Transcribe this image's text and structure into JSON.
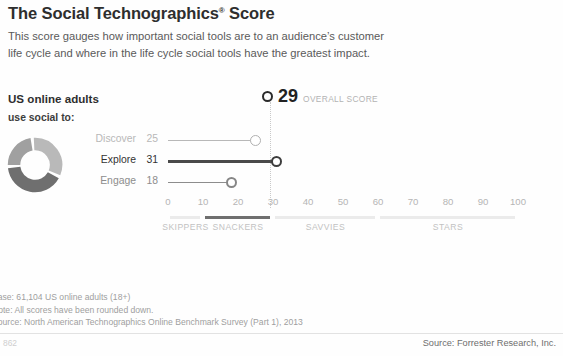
{
  "header": {
    "title_main": "The Social Technographics",
    "title_sup": "®",
    "title_tail": " Score",
    "subtitle_line1": "This score gauges how important social tools are to an audience’s customer",
    "subtitle_line2": "life cycle and where in the life cycle social tools have the greatest impact."
  },
  "audience": {
    "heading": "US online adults",
    "subheading": "use social to:"
  },
  "score": {
    "value": "29",
    "caption": "OVERALL SCORE"
  },
  "footnotes": {
    "base": "Base: 61,104 US online adults (18+)",
    "note": "Note: All scores have been rounded down.",
    "source": "Source: North American Technographics Online Benchmark Survey (Part 1), 2013"
  },
  "footer": {
    "page_number": "862",
    "source": "Source: Forrester Research, Inc."
  },
  "chart_data": {
    "type": "bar",
    "title": "The Social Technographics® Score",
    "subtitle": "This score gauges how important social tools are to an audience’s customer life cycle and where in the life cycle social tools have the greatest impact.",
    "orientation": "horizontal",
    "xlabel": "",
    "ylabel": "",
    "xlim": [
      0,
      100
    ],
    "ticks": [
      "0",
      "10",
      "20",
      "30",
      "40",
      "50",
      "60",
      "70",
      "80",
      "90",
      "100"
    ],
    "tick_values": [
      0,
      10,
      20,
      30,
      40,
      50,
      60,
      70,
      80,
      90,
      100
    ],
    "grid": false,
    "legend": "none",
    "categories": [
      "Discover",
      "Explore",
      "Engage"
    ],
    "values": [
      25,
      31,
      18
    ],
    "series": [
      {
        "name": "US online adults use social to",
        "points": [
          {
            "label": "Discover",
            "value": 25,
            "value_text": "25",
            "color": "#b8b8b8"
          },
          {
            "label": "Explore",
            "value": 31,
            "value_text": "31",
            "color": "#4a4a4a"
          },
          {
            "label": "Engage",
            "value": 18,
            "value_text": "18",
            "color": "#8d8d8d"
          }
        ]
      }
    ],
    "overall_score": 29,
    "overall_score_text": "29",
    "overall_score_caption": "OVERALL SCORE",
    "donut": {
      "segments": [
        {
          "label": "Discover",
          "value": 25,
          "color": "#b9b9b9"
        },
        {
          "label": "Explore",
          "value": 31,
          "color": "#6f6f6f"
        },
        {
          "label": "Engage",
          "value": 18,
          "color": "#a0a0a0"
        }
      ]
    },
    "bands": [
      {
        "label": "SKIPPERS",
        "start": 0,
        "end": 10,
        "center": 5,
        "active": false
      },
      {
        "label": "SNACKERS",
        "start": 10,
        "end": 30,
        "center": 20,
        "active": true
      },
      {
        "label": "SAVVIES",
        "start": 30,
        "end": 60,
        "center": 45,
        "active": false
      },
      {
        "label": "STARS",
        "start": 60,
        "end": 100,
        "center": 80,
        "active": false
      }
    ],
    "annotations": [
      "Base: 61,104 US online adults (18+)",
      "Note: All scores have been rounded down.",
      "Source: North American Technographics Online Benchmark Survey (Part 1), 2013"
    ]
  }
}
